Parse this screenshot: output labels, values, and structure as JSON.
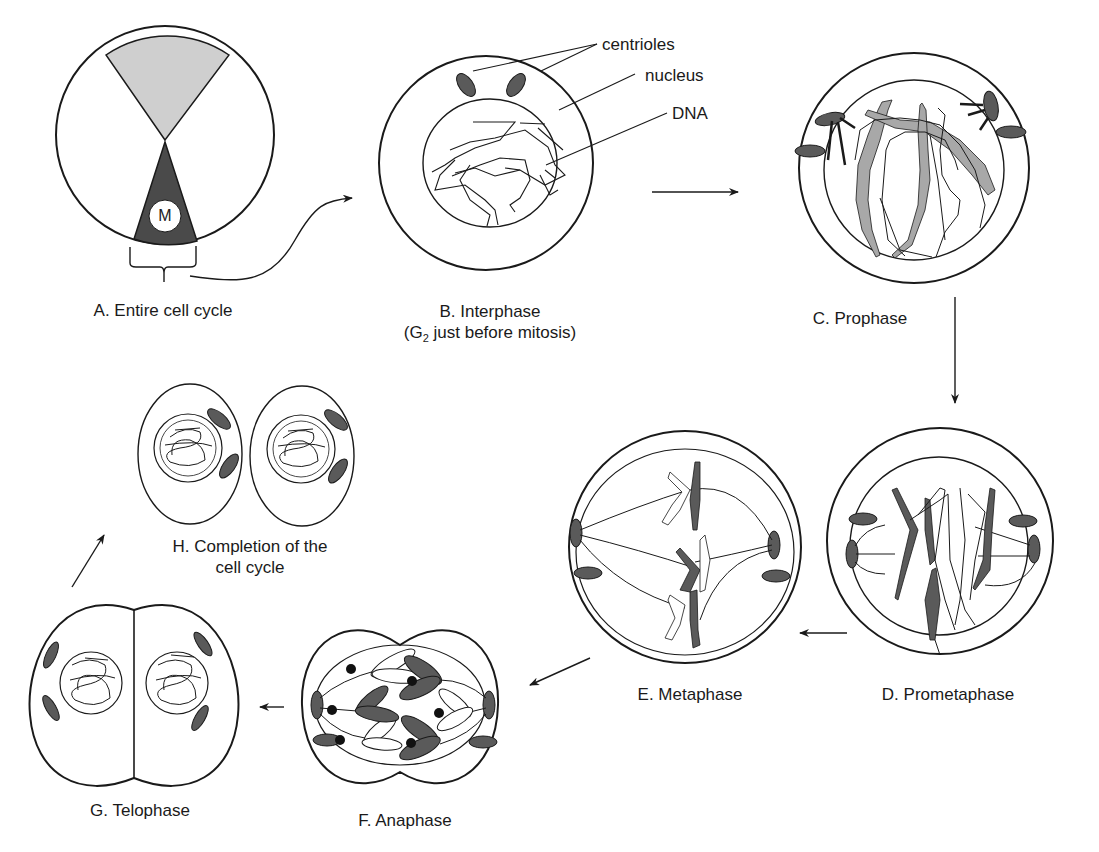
{
  "diagram": {
    "colors": {
      "outline": "#1a1a1a",
      "centriole_fill": "#5a5a5a",
      "chromosome_dark": "#5a5a5a",
      "chromosome_light": "#a8a8a8",
      "interphase_wedge": "#cfcfcf",
      "m_phase_wedge": "#4a4a4a",
      "background": "#ffffff"
    },
    "stages": [
      {
        "id": "A",
        "label": "A. Entire cell cycle",
        "wedge_label": "M"
      },
      {
        "id": "B",
        "label": "B. Interphase",
        "sublabel_prefix": "(G",
        "sublabel_sub": "2",
        "sublabel_suffix": " just before mitosis)"
      },
      {
        "id": "C",
        "label": "C. Prophase"
      },
      {
        "id": "D",
        "label": "D. Prometaphase"
      },
      {
        "id": "E",
        "label": "E. Metaphase"
      },
      {
        "id": "F",
        "label": "F. Anaphase"
      },
      {
        "id": "G",
        "label": "G. Telophase"
      },
      {
        "id": "H",
        "label_line1": "H. Completion of the",
        "label_line2": "cell cycle"
      }
    ],
    "annotations": {
      "centrioles": "centrioles",
      "nucleus": "nucleus",
      "dna": "DNA"
    },
    "flow": [
      "A",
      "B",
      "C",
      "D",
      "E",
      "F",
      "G",
      "H"
    ]
  }
}
